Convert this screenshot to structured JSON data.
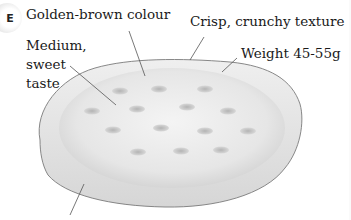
{
  "badge": {
    "letter": "E"
  },
  "labels": {
    "colour": "Golden-brown colour",
    "taste_line1": "Medium,",
    "taste_line2": "sweet",
    "taste_line3": "taste",
    "texture": "Crisp, crunchy texture",
    "weight": "Weight 45-55g"
  },
  "colors": {
    "biscuit_fill": "#e9e9e9",
    "biscuit_outline": "#777777",
    "hole": "#bdbdbd",
    "text": "#1a1a1a"
  }
}
